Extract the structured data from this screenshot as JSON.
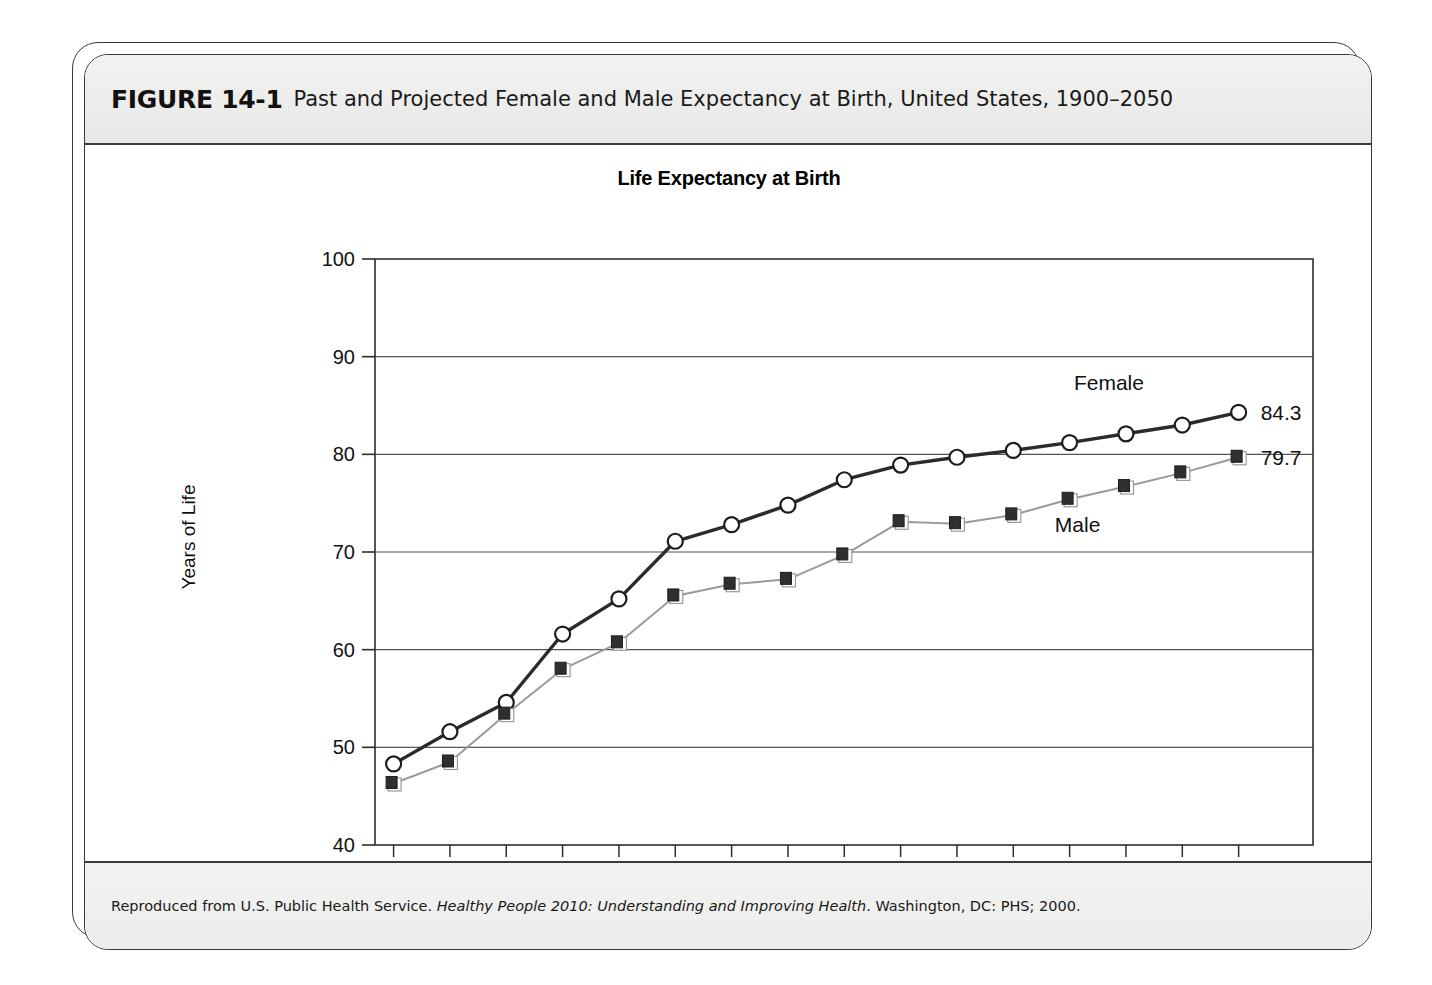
{
  "figure": {
    "label": "FIGURE 14-1",
    "caption": "Past and Projected Female and Male Expectancy at Birth, United States, 1900–2050",
    "source_prefix": "Reproduced from U.S. Public Health Service. ",
    "source_italic": "Healthy People 2010: Understanding and Improving Health",
    "source_suffix": ". Washington, DC: PHS; 2000."
  },
  "chart_data": {
    "type": "line",
    "title": "Life Expectancy at Birth",
    "xlabel": "",
    "ylabel": "Years of Life",
    "ylim": [
      40,
      100
    ],
    "yticks": [
      40,
      50,
      60,
      70,
      80,
      90,
      100
    ],
    "grid": true,
    "legend_position": "inline-annotations",
    "categories": [
      "1900*",
      "1910*",
      "1920*",
      "1930",
      "1940",
      "1950",
      "1960",
      "1970",
      "1980",
      "1990",
      "2000",
      "2010",
      "2020",
      "2030",
      "2040",
      "2050"
    ],
    "x": [
      1900,
      1910,
      1920,
      1930,
      1940,
      1950,
      1960,
      1970,
      1980,
      1990,
      2000,
      2010,
      2020,
      2030,
      2040,
      2050
    ],
    "series": [
      {
        "name": "Female",
        "marker": "open-circle",
        "color": "#2b2b2b",
        "values": [
          48.3,
          51.6,
          54.6,
          61.6,
          65.2,
          71.1,
          72.8,
          74.8,
          77.4,
          78.9,
          79.7,
          80.4,
          81.2,
          82.1,
          83.0,
          84.3
        ]
      },
      {
        "name": "Male",
        "marker": "filled-square",
        "color": "#8c8c8c",
        "values": [
          46.3,
          48.5,
          53.4,
          58.0,
          60.7,
          65.5,
          66.7,
          67.2,
          69.7,
          73.1,
          72.9,
          73.8,
          75.4,
          76.7,
          78.1,
          79.7
        ]
      }
    ],
    "annotations": [
      {
        "text": "Female",
        "series": "Female"
      },
      {
        "text": "Male",
        "series": "Male"
      },
      {
        "text": "84.3",
        "series": "Female",
        "kind": "end-value"
      },
      {
        "text": "79.7",
        "series": "Male",
        "kind": "end-value"
      }
    ]
  }
}
